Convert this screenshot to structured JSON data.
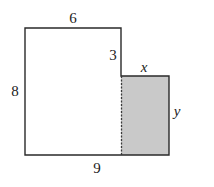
{
  "diagram": {
    "type": "composite-rectilinear-shape",
    "colors": {
      "outline": "#2a2a2a",
      "shaded_fill": "#c9c9c9",
      "background": "#ffffff"
    },
    "labels": {
      "top": "6",
      "step": "3",
      "shaded_top": "x",
      "left": "8",
      "shaded_right": "y",
      "bottom": "9"
    },
    "geometry": {
      "outer_top_left": [
        25,
        28
      ],
      "upper_top_right": [
        121,
        28
      ],
      "step_corner": [
        121,
        76
      ],
      "shaded_top_right": [
        169,
        76
      ],
      "shaded_bottom_right": [
        169,
        155
      ],
      "outer_bottom_left": [
        25,
        155
      ]
    }
  }
}
